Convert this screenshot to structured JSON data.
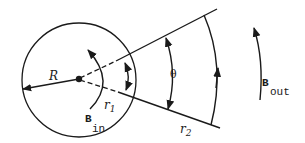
{
  "diagram": {
    "labels": {
      "R": "R",
      "r": "r",
      "r1_sub": "1",
      "r2_sub": "2",
      "theta": "θ",
      "B": "B",
      "in": "in",
      "out": "out"
    },
    "colors": {
      "stroke": "#1a1a1a",
      "background": "#ffffff"
    }
  }
}
